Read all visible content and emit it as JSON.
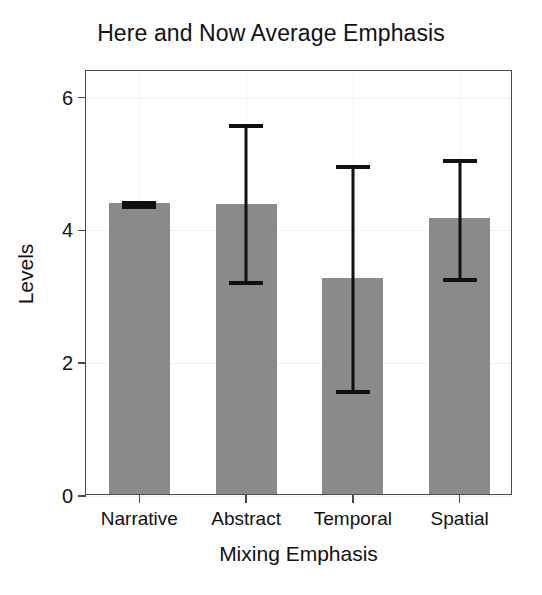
{
  "chart_data": {
    "type": "bar",
    "title": "Here and Now Average Emphasis",
    "xlabel": "Mixing Emphasis",
    "ylabel": "Levels",
    "categories": [
      "Narrative",
      "Abstract",
      "Temporal",
      "Spatial"
    ],
    "values": [
      4.38,
      4.37,
      3.26,
      4.15
    ],
    "error_bars": [
      {
        "category": "Narrative",
        "lower": 4.35,
        "upper": 4.41
      },
      {
        "category": "Abstract",
        "lower": 3.21,
        "upper": 5.57
      },
      {
        "category": "Temporal",
        "lower": 1.56,
        "upper": 4.96
      },
      {
        "category": "Spatial",
        "lower": 3.25,
        "upper": 5.04
      }
    ],
    "ylim": [
      0,
      6.4
    ],
    "yticks": [
      0,
      2,
      4,
      6
    ],
    "ytick_labels": [
      "0",
      "2",
      "4",
      "6"
    ],
    "grid": "faint",
    "legend": "none",
    "bar_color": "#8a8a8a",
    "error_bar_color": "#101010",
    "axis_color": "#4a4a4a",
    "background": "#ffffff"
  }
}
